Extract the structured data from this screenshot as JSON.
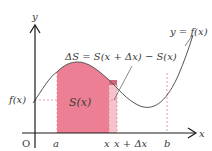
{
  "figure": {
    "axis_labels": {
      "x": "x",
      "y": "y",
      "origin": "O"
    },
    "curve_label": "y = f(x)",
    "y_tick_label": "f(x)",
    "x_tick_labels": {
      "a": "a",
      "x": "x",
      "x_plus_dx": "x + Δx",
      "b": "b"
    },
    "area_label": "S(x)",
    "delta_formula": "ΔS = S(x + Δx) − S(x)",
    "colors": {
      "area": "#ec7f93",
      "strip": "#f6c3cc",
      "strip_top": "#c94f66",
      "curve": "#555555",
      "axis": "#1a1a1a",
      "dashed": "#e08a9a"
    }
  }
}
